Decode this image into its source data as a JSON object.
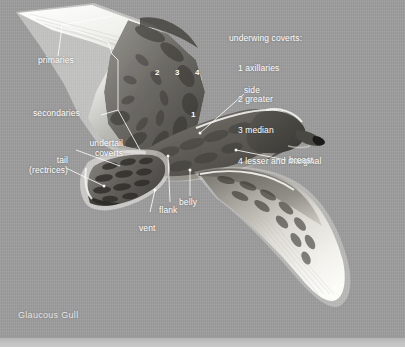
{
  "plate": {
    "caption": "Glaucous Gull",
    "background_color": "#9d9d9d",
    "label_color": "#ffffff",
    "leader_color": "#ffffff"
  },
  "legend": {
    "heading": "underwing coverts:",
    "items": [
      "1 axillaries",
      "2 greater",
      "3 median",
      "4 lesser and marginal"
    ]
  },
  "labels": {
    "primaries": "primaries",
    "secondaries": "secondaries",
    "undertail_coverts_l1": "undertail",
    "undertail_coverts_l2": "coverts",
    "tail_l1": "tail",
    "tail_l2": "(rectrices)",
    "vent": "vent",
    "flank": "flank",
    "belly": "belly",
    "side": "side",
    "breast": "breast"
  },
  "callout_numbers": {
    "n1": "1",
    "n2": "2",
    "n3": "3",
    "n4": "4"
  }
}
